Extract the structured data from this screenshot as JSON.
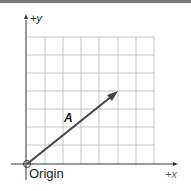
{
  "diagram": {
    "axes": {
      "x_label": "+x",
      "y_label": "+y"
    },
    "origin_label": "Origin",
    "vector": {
      "label": "A",
      "start": [
        0,
        0
      ],
      "end": [
        5,
        4
      ]
    },
    "grid": {
      "columns": 7,
      "rows": 7
    },
    "colors": {
      "grid": "#b0b0b0",
      "axis": "#333333",
      "vector": "#444444",
      "border": "#7a7a7a"
    }
  }
}
